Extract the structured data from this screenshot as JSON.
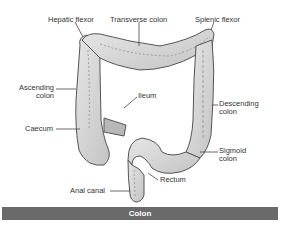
{
  "diagram": {
    "title": "Colon",
    "labels": {
      "hepatic_flexor": "Hepatic flexor",
      "transverse_colon": "Transverse colon",
      "splenic_flexor": "Splenic flexor",
      "ascending_colon_line1": "Ascending",
      "ascending_colon_line2": "colon",
      "ileum": "Ileum",
      "descending_colon_line1": "Descending",
      "descending_colon_line2": "colon",
      "caecum": "Caecum",
      "sigmoid_colon_line1": "Sigmoid",
      "sigmoid_colon_line2": "colon",
      "rectum": "Rectum",
      "anal_canal": "Anal canal"
    },
    "colors": {
      "tissue_fill": "#d8d8d8",
      "tissue_stroke": "#555555",
      "leader_line": "#444444",
      "caption_bar": "#6a6a6a",
      "caption_text": "#ffffff"
    }
  }
}
